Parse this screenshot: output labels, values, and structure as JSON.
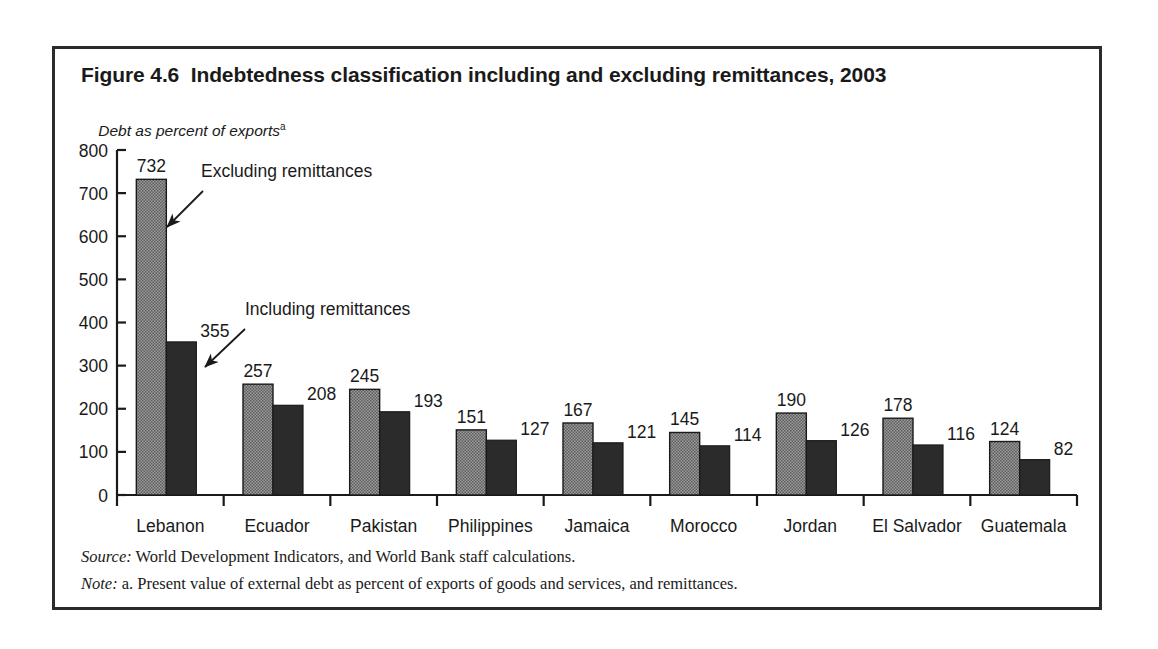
{
  "figure": {
    "title": "Figure 4.6  Indebtedness classification including and excluding remittances, 2003",
    "axis_caption": "Debt as percent of exports",
    "axis_caption_superscript": "a",
    "source_label": "Source:",
    "source_text": " World Development Indicators, and World Bank staff calculations.",
    "note_label": "Note:",
    "note_text": " a. Present value of external debt as percent of exports of goods and services, and remittances."
  },
  "colors": {
    "excluding_bar": "#8f8f8f",
    "including_bar": "#2b2b2b",
    "axis": "#1a1a1a",
    "frame": "#2b2b2b",
    "background": "#ffffff"
  },
  "chart_data": {
    "type": "bar",
    "title": "Figure 4.6  Indebtedness classification including and excluding remittances, 2003",
    "xlabel": "",
    "ylabel": "Debt as percent of exports",
    "ylim": [
      0,
      800
    ],
    "yticks": [
      0,
      100,
      200,
      300,
      400,
      500,
      600,
      700,
      800
    ],
    "ytick_labels": [
      "0",
      "100",
      "200",
      "300",
      "400",
      "500",
      "600",
      "700",
      "800"
    ],
    "grid": false,
    "legend_position": "annotations",
    "categories": [
      "Lebanon",
      "Ecuador",
      "Pakistan",
      "Philippines",
      "Jamaica",
      "Morocco",
      "Jordan",
      "El Salvador",
      "Guatemala"
    ],
    "series": [
      {
        "name": "Excluding remittances",
        "values": [
          732,
          257,
          245,
          151,
          167,
          145,
          190,
          178,
          124
        ]
      },
      {
        "name": "Including remittances",
        "values": [
          355,
          208,
          193,
          127,
          121,
          114,
          126,
          116,
          82
        ]
      }
    ],
    "annotations": [
      {
        "text": "Excluding remittances",
        "target_series": "Excluding remittances",
        "target_category": "Lebanon"
      },
      {
        "text": "Including remittances",
        "target_series": "Including remittances",
        "target_category": "Lebanon"
      }
    ]
  }
}
